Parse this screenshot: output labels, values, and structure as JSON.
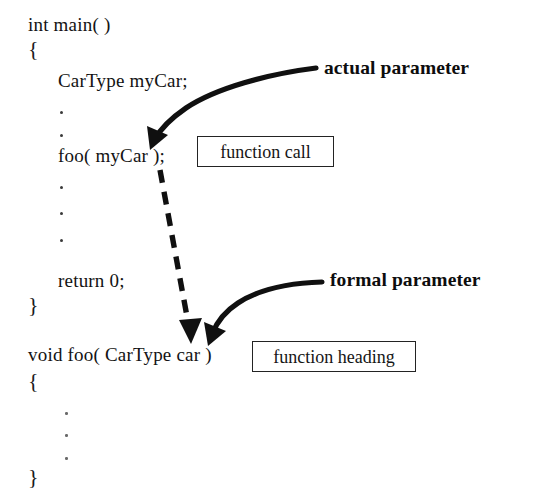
{
  "diagram": {
    "background_color": "#ffffff",
    "ink_color": "#121212"
  },
  "code": {
    "main_function": {
      "signature": "int main( )",
      "open_brace": "{",
      "declaration": "CarType myCar;",
      "call_statement": "foo( myCar );",
      "return_statement": "return 0;",
      "close_brace": "}"
    },
    "foo_function": {
      "heading": "void foo( CarType car )",
      "open_brace": "{",
      "close_brace": "}"
    }
  },
  "callouts": [
    {
      "id": "actual-parameter",
      "label": "actual parameter",
      "bold": true
    },
    {
      "id": "formal-parameter",
      "label": "formal parameter",
      "bold": true
    }
  ],
  "boxes": [
    {
      "id": "function-call",
      "label": "function call"
    },
    {
      "id": "function-heading",
      "label": "function heading"
    }
  ],
  "arrows": [
    {
      "id": "actual-parameter-arrow",
      "style": "solid",
      "from_label": "actual parameter",
      "to_target": "myCar argument in foo( myCar );"
    },
    {
      "id": "parameter-passing-arrow",
      "style": "dashed",
      "from_label": "foo( myCar ); call site",
      "to_target": "car parameter in void foo( CarType car )"
    },
    {
      "id": "formal-parameter-arrow",
      "style": "solid",
      "from_label": "formal parameter",
      "to_target": "car parameter in void foo( CarType car )"
    }
  ]
}
